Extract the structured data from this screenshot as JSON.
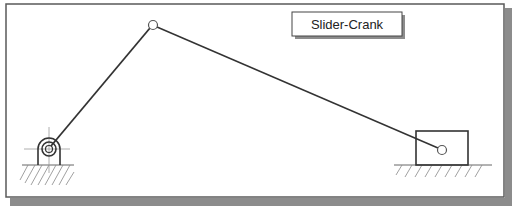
{
  "diagram": {
    "title": "Slider-Crank",
    "colors": {
      "background": "#ffffff",
      "frame": "#5a5a5a",
      "shadow": "#8c8c8c",
      "link": "#333333",
      "joint_fill": "#ffffff",
      "hatch": "#888888",
      "centerline": "#999999"
    },
    "elements": {
      "ground_pivot": {
        "x": 46,
        "y": 142
      },
      "crank_pin": {
        "x": 153,
        "y": 25
      },
      "slider_pin": {
        "x": 442,
        "y": 150
      },
      "slider_block": {
        "x": 416,
        "y": 131,
        "width": 52,
        "height": 34
      }
    },
    "icons": [
      "pin-joint-icon",
      "ground-hatch-icon",
      "slider-block-icon"
    ]
  }
}
